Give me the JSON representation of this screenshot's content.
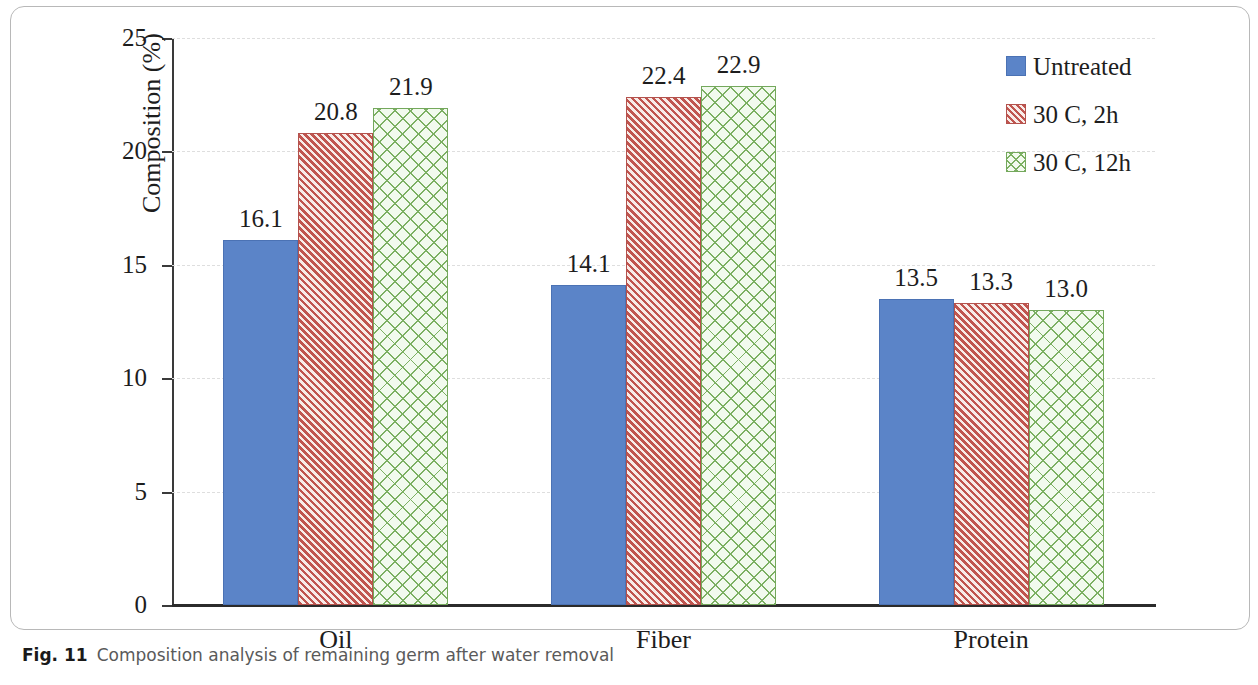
{
  "caption": {
    "label": "Fig. 11",
    "text": "Composition analysis of remaining germ after water removal"
  },
  "chart_data": {
    "type": "bar",
    "title": "",
    "xlabel": "",
    "ylabel": "Composition (%)",
    "ylim": [
      0,
      25
    ],
    "yticks": [
      0,
      5,
      10,
      15,
      20,
      25
    ],
    "ytick_labels": [
      "0",
      "5",
      "10",
      "15",
      "20",
      "25"
    ],
    "grid": true,
    "grid_style": "dashed-horizontal",
    "legend_position": "top-right",
    "categories": [
      "Oil",
      "Fiber",
      "Protein"
    ],
    "series": [
      {
        "name": "Untreated",
        "color": "#5b84c8",
        "pattern": "solid",
        "values": [
          16.1,
          14.1,
          13.5
        ],
        "labels": [
          "16.1",
          "14.1",
          "13.5"
        ]
      },
      {
        "name": "30 C, 2h",
        "color": "#c0554f",
        "pattern": "diagonal-hatch",
        "values": [
          20.8,
          22.4,
          13.3
        ],
        "labels": [
          "20.8",
          "22.4",
          "13.3"
        ]
      },
      {
        "name": "30 C, 12h",
        "color": "#7cb062",
        "pattern": "cross-hatch",
        "values": [
          21.9,
          22.9,
          13.0
        ],
        "labels": [
          "21.9",
          "22.9",
          "13.0"
        ]
      }
    ]
  }
}
